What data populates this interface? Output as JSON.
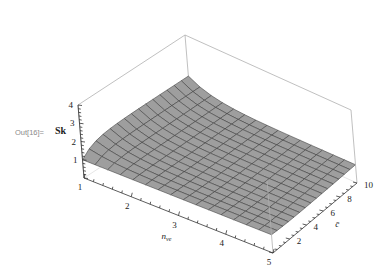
{
  "cell": {
    "out_label": "Out[16]=",
    "expression": "Sk"
  },
  "chart_data": {
    "type": "surface3d",
    "title": "",
    "x_axis": {
      "label": "n_ve",
      "label_display": "nve",
      "range": [
        1,
        5
      ],
      "ticks": [
        "1",
        "2",
        "3",
        "4",
        "5"
      ]
    },
    "y_axis": {
      "label": "c̄",
      "label_display": "c̄",
      "range": [
        0,
        10
      ],
      "ticks": [
        "2",
        "4",
        "6",
        "8",
        "10"
      ]
    },
    "z_axis": {
      "label": "",
      "range": [
        0,
        4
      ],
      "ticks": [
        "1",
        "2",
        "3",
        "4"
      ]
    },
    "surface_color": "#9e9e9e",
    "mesh_color": "#3a3a3a",
    "box_color": "#b0b0b0",
    "grid_divisions": 15,
    "sample_points": [
      {
        "n_ve": 1,
        "c": 0.1,
        "z": 1.0
      },
      {
        "n_ve": 1,
        "c": 2,
        "z": 1.5
      },
      {
        "n_ve": 1,
        "c": 10,
        "z": 1.7
      },
      {
        "n_ve": 3,
        "c": 5,
        "z": 1.1
      },
      {
        "n_ve": 5,
        "c": 0.1,
        "z": 0.9
      },
      {
        "n_ve": 5,
        "c": 10,
        "z": 1.2
      }
    ]
  }
}
